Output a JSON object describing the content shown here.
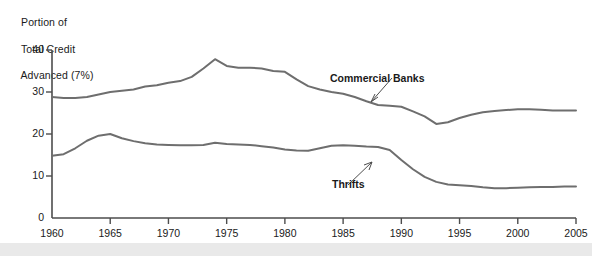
{
  "chart_data": {
    "type": "line",
    "title": "Portion of\nTotal Credit\nAdvanced (7%)",
    "title_lines": [
      "Portion of",
      "Total Credit",
      "Advanced (7%)"
    ],
    "xlabel": "",
    "ylabel": "Portion of Total Credit Advanced (7%)",
    "xlim": [
      1960,
      2005
    ],
    "ylim": [
      0,
      40
    ],
    "grid": false,
    "legend_position": "inline-annotations",
    "xticks": [
      1960,
      1965,
      1970,
      1975,
      1980,
      1985,
      1990,
      1995,
      2000,
      2005
    ],
    "yticks": [
      0,
      10,
      20,
      30,
      40
    ],
    "annotations": [
      {
        "text": "Commercial Banks",
        "series": "Commercial Banks",
        "points_to_year": 1982
      },
      {
        "text": "Thrifts",
        "series": "Thrifts",
        "points_to_year": 1987
      }
    ],
    "series": [
      {
        "name": "Commercial Banks",
        "color": "#6e6e6e",
        "x": [
          1960,
          1961,
          1962,
          1963,
          1964,
          1965,
          1966,
          1967,
          1968,
          1969,
          1970,
          1971,
          1972,
          1973,
          1974,
          1975,
          1976,
          1977,
          1978,
          1979,
          1980,
          1981,
          1982,
          1983,
          1984,
          1985,
          1986,
          1987,
          1988,
          1989,
          1990,
          1991,
          1992,
          1993,
          1994,
          1995,
          1996,
          1997,
          1998,
          1999,
          2000,
          2001,
          2002,
          2003,
          2004,
          2005
        ],
        "values": [
          28.8,
          28.6,
          28.6,
          28.8,
          29.4,
          30.0,
          30.3,
          30.6,
          31.3,
          31.6,
          32.2,
          32.6,
          33.6,
          35.6,
          37.8,
          36.2,
          35.8,
          35.8,
          35.6,
          35.0,
          34.8,
          33.0,
          31.4,
          30.6,
          30.0,
          29.6,
          28.8,
          27.8,
          26.9,
          26.7,
          26.5,
          25.4,
          24.2,
          22.4,
          22.8,
          23.8,
          24.6,
          25.2,
          25.5,
          25.7,
          25.9,
          25.9,
          25.8,
          25.6,
          25.6,
          25.6
        ]
      },
      {
        "name": "Thrifts",
        "color": "#6e6e6e",
        "x": [
          1960,
          1961,
          1962,
          1963,
          1964,
          1965,
          1966,
          1967,
          1968,
          1969,
          1970,
          1971,
          1972,
          1973,
          1974,
          1975,
          1976,
          1977,
          1978,
          1979,
          1980,
          1981,
          1982,
          1983,
          1984,
          1985,
          1986,
          1987,
          1988,
          1989,
          1990,
          1991,
          1992,
          1993,
          1994,
          1995,
          1996,
          1997,
          1998,
          1999,
          2000,
          2001,
          2002,
          2003,
          2004,
          2005
        ],
        "values": [
          14.8,
          15.2,
          16.6,
          18.4,
          19.6,
          20.0,
          19.0,
          18.3,
          17.8,
          17.5,
          17.4,
          17.3,
          17.3,
          17.4,
          17.9,
          17.6,
          17.5,
          17.4,
          17.1,
          16.8,
          16.3,
          16.1,
          16.0,
          16.6,
          17.2,
          17.3,
          17.2,
          17.0,
          16.9,
          16.2,
          13.8,
          11.6,
          9.8,
          8.6,
          8.0,
          7.8,
          7.6,
          7.3,
          7.1,
          7.1,
          7.2,
          7.3,
          7.4,
          7.4,
          7.5,
          7.5
        ]
      }
    ]
  },
  "axes": {
    "y_tick_labels": [
      "0",
      "10",
      "20",
      "30",
      "40"
    ],
    "x_tick_labels": [
      "1960",
      "1965",
      "1970",
      "1975",
      "1980",
      "1985",
      "1990",
      "1995",
      "2000",
      "2005"
    ]
  }
}
